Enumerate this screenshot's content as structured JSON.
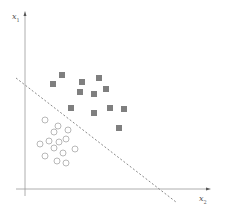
{
  "chart_data": {
    "type": "scatter",
    "title": "",
    "xlabel": "x2",
    "ylabel": "x1",
    "axes": {
      "y_axis": {
        "label_main": "x",
        "label_sub": "1"
      },
      "x_axis": {
        "label_main": "x",
        "label_sub": "2"
      },
      "grid": false,
      "ticks": false
    },
    "series": [
      {
        "name": "class-squares",
        "marker": "filled-square",
        "color": "#7f7f7f",
        "points": [
          [
            62,
            75
          ],
          [
            53,
            84
          ],
          [
            82,
            82
          ],
          [
            99,
            78
          ],
          [
            80,
            92
          ],
          [
            94,
            94
          ],
          [
            106,
            89
          ],
          [
            71,
            108
          ],
          [
            94,
            113
          ],
          [
            110,
            108
          ],
          [
            124,
            109
          ],
          [
            119,
            128
          ]
        ]
      },
      {
        "name": "class-circles",
        "marker": "hollow-circle",
        "color": "#b0b0b0",
        "points": [
          [
            45,
            120
          ],
          [
            58,
            126
          ],
          [
            54,
            132
          ],
          [
            68,
            130
          ],
          [
            40,
            144
          ],
          [
            49,
            141
          ],
          [
            59,
            142
          ],
          [
            66,
            139
          ],
          [
            54,
            148
          ],
          [
            75,
            149
          ],
          [
            45,
            156
          ],
          [
            63,
            153
          ],
          [
            57,
            161
          ],
          [
            66,
            163
          ]
        ]
      }
    ],
    "decision_boundary": {
      "style": "dashed",
      "color": "#8a8a8a",
      "from": [
        16,
        78
      ],
      "to": [
        176,
        202
      ]
    },
    "legend": null
  },
  "labels": {
    "y_axis_main": "x",
    "y_axis_sub": "1",
    "x_axis_main": "x",
    "x_axis_sub": "2"
  }
}
